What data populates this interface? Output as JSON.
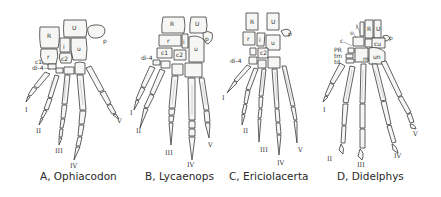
{
  "figure": {
    "panels": [
      {
        "id": "A",
        "caption": "A, Ophiacodon",
        "bone_labels": [
          "R",
          "U",
          "p",
          "r",
          "i",
          "u",
          "c2",
          "c1",
          "di-4"
        ],
        "digits": [
          "I",
          "II",
          "III",
          "IV",
          "V"
        ]
      },
      {
        "id": "B",
        "caption": "B, Lycaenops",
        "bone_labels": [
          "R",
          "U",
          "p",
          "r",
          "i",
          "u",
          "c1",
          "c2",
          "di-4"
        ],
        "digits": [
          "I",
          "II",
          "III",
          "IV",
          "V"
        ]
      },
      {
        "id": "C",
        "caption": "C, Ericiolacerta",
        "bone_labels": [
          "R",
          "U",
          "p",
          "r",
          "i",
          "u",
          "c2",
          "di-4"
        ],
        "digits": [
          "I",
          "II",
          "III",
          "IV",
          "V"
        ]
      },
      {
        "id": "D",
        "caption": "D, Didelphys",
        "bone_labels": [
          "R",
          "U",
          "p",
          "l",
          "s",
          "c",
          "cu",
          "PR",
          "tm",
          "td",
          "m",
          "un"
        ],
        "digits": [
          "I",
          "II",
          "III",
          "IV",
          "V"
        ]
      }
    ]
  }
}
